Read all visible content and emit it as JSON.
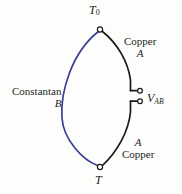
{
  "figure": {
    "background_color": "#fdfdfc",
    "wire_colors": {
      "constantan_arc": "#3b3f93",
      "copper_arc": "#1a1a1a",
      "node_stroke": "#1a1a1a",
      "node_fill": "#ffffff"
    }
  },
  "labels": {
    "t0": {
      "symbol": "T",
      "subscript": "0"
    },
    "copper_top": {
      "material": "Copper",
      "conductor": "A"
    },
    "constantan_left": {
      "material": "Constantan",
      "conductor": "B"
    },
    "voltage": {
      "symbol": "V",
      "subscript": "AB"
    },
    "copper_bottom": {
      "conductor": "A",
      "material": "Copper"
    },
    "t": {
      "symbol": "T"
    }
  },
  "nodes": [
    {
      "name": "junction-top",
      "x": 100,
      "y": 29
    },
    {
      "name": "junction-bottom",
      "x": 100,
      "y": 167
    },
    {
      "name": "terminal-upper",
      "x": 140,
      "y": 91
    },
    {
      "name": "terminal-lower",
      "x": 140,
      "y": 101
    }
  ]
}
